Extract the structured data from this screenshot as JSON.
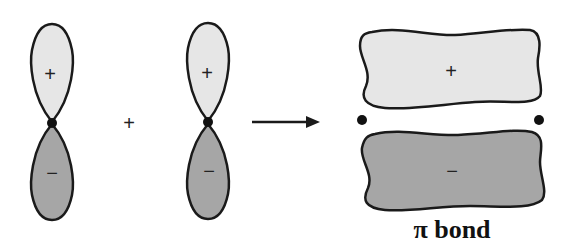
{
  "diagram": {
    "type": "pi-bond-formation",
    "colors": {
      "positive_lobe": "#e6e6e6",
      "negative_lobe": "#a6a6a6",
      "outline": "#1a1a1a",
      "nucleus": "#111111"
    },
    "orbital_left": {
      "top_sign": "+",
      "bottom_sign": "−"
    },
    "plus_operator": "+",
    "orbital_right": {
      "top_sign": "+",
      "bottom_sign": "−"
    },
    "arrow": "→",
    "result": {
      "top_sign": "+",
      "bottom_sign": "−",
      "label": "π bond"
    }
  }
}
